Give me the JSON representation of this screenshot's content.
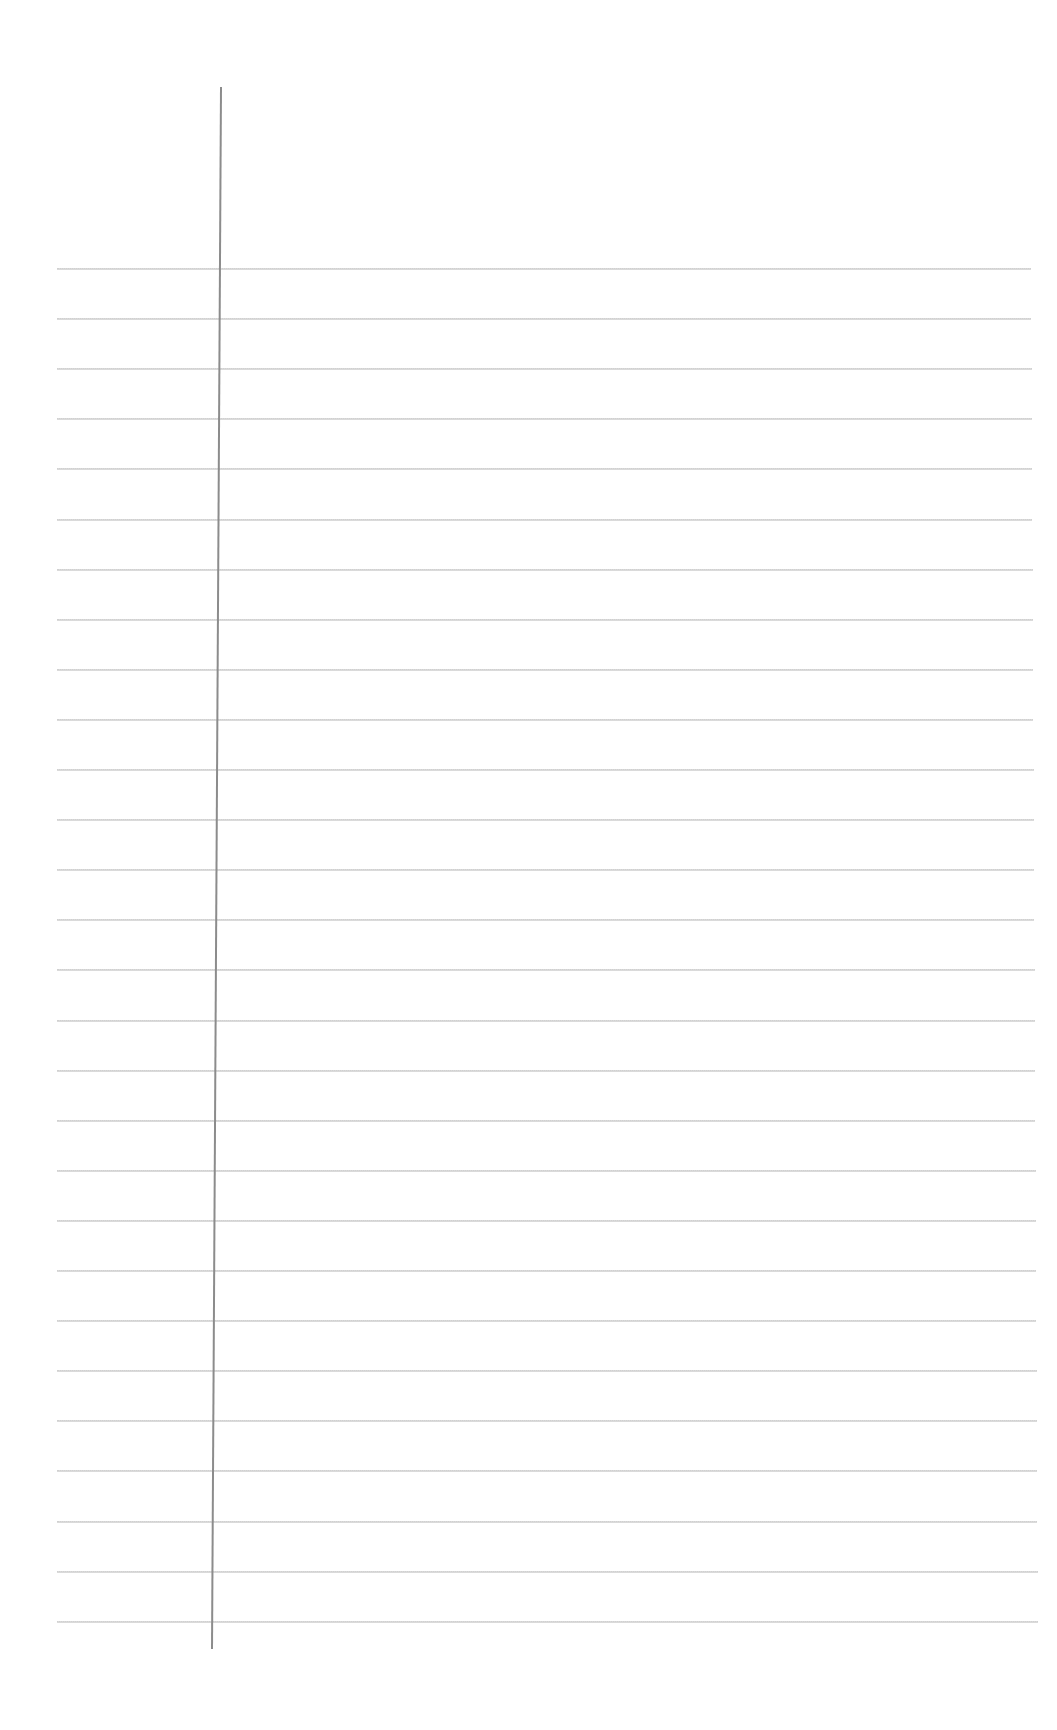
{
  "page": {
    "type": "lined-notebook-paper",
    "background_color": "#ffffff",
    "content": ""
  },
  "margin_line": {
    "color": "#8c8c8c",
    "x_top": 220,
    "y_top": 87,
    "x_bottom": 229,
    "y_bottom": 1649
  },
  "rules": {
    "color": "#d4d4d4",
    "count": 28,
    "first_y": 268,
    "spacing": 50.1,
    "x_start": 57,
    "x_end_top": 1031,
    "x_end_bottom": 1038,
    "lines": []
  }
}
